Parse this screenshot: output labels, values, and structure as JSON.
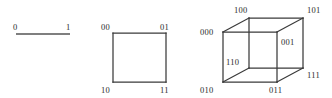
{
  "figure": {
    "background_color": "#ffffff",
    "line_color": "#3a3a3a",
    "text_color": "#2b2b2b",
    "width": 332,
    "height": 98
  },
  "diagrams": [
    {
      "name": "1-cube",
      "shape": "line-segment",
      "dimension": 1,
      "vertices": [
        {
          "label": "0",
          "x": 16,
          "y": 34,
          "label_x": 13,
          "label_y": 30
        },
        {
          "label": "1",
          "x": 70,
          "y": 34,
          "label_x": 66,
          "label_y": 30
        }
      ],
      "edges": [
        [
          0,
          1
        ]
      ]
    },
    {
      "name": "2-cube",
      "shape": "square",
      "dimension": 2,
      "vertices": [
        {
          "label": "00",
          "x": 113,
          "y": 33,
          "label_x": 101,
          "label_y": 30
        },
        {
          "label": "01",
          "x": 166,
          "y": 33,
          "label_x": 160,
          "label_y": 30
        },
        {
          "label": "10",
          "x": 113,
          "y": 82,
          "label_x": 101,
          "label_y": 93
        },
        {
          "label": "11",
          "x": 166,
          "y": 82,
          "label_x": 160,
          "label_y": 93
        }
      ],
      "edges": [
        [
          0,
          1
        ],
        [
          1,
          3
        ],
        [
          3,
          2
        ],
        [
          2,
          0
        ]
      ]
    },
    {
      "name": "3-cube",
      "shape": "cube",
      "dimension": 3,
      "vertices": [
        {
          "label": "100",
          "x": 249,
          "y": 18,
          "label_x": 234,
          "label_y": 13
        },
        {
          "label": "101",
          "x": 303,
          "y": 18,
          "label_x": 307,
          "label_y": 13
        },
        {
          "label": "000",
          "x": 223,
          "y": 32,
          "label_x": 200,
          "label_y": 35
        },
        {
          "label": "001",
          "x": 277,
          "y": 32,
          "label_x": 281,
          "label_y": 45
        },
        {
          "label": "110",
          "x": 249,
          "y": 68,
          "label_x": 226,
          "label_y": 65
        },
        {
          "label": "111",
          "x": 303,
          "y": 68,
          "label_x": 307,
          "label_y": 78
        },
        {
          "label": "010",
          "x": 223,
          "y": 82,
          "label_x": 200,
          "label_y": 93
        },
        {
          "label": "011",
          "x": 277,
          "y": 82,
          "label_x": 269,
          "label_y": 93
        }
      ],
      "edges": [
        [
          0,
          1
        ],
        [
          0,
          2
        ],
        [
          0,
          4
        ],
        [
          1,
          3
        ],
        [
          1,
          5
        ],
        [
          2,
          3
        ],
        [
          2,
          6
        ],
        [
          3,
          7
        ],
        [
          4,
          5
        ],
        [
          4,
          6
        ],
        [
          5,
          7
        ],
        [
          6,
          7
        ]
      ]
    }
  ]
}
